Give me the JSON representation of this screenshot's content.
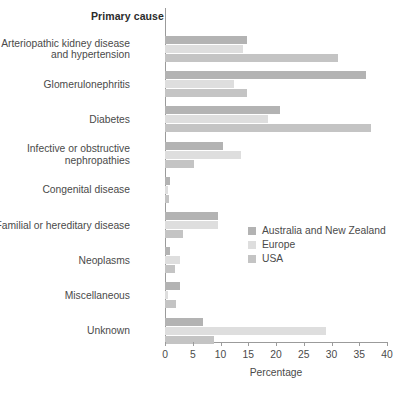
{
  "chart_data": {
    "type": "bar",
    "orientation": "horizontal",
    "title": "",
    "category_axis_title": "Primary cause",
    "xlabel": "Percentage",
    "ylabel": "",
    "xlim": [
      0,
      40
    ],
    "xticks": [
      0,
      5,
      10,
      15,
      20,
      25,
      30,
      35,
      40
    ],
    "grid": false,
    "legend_position": "middle-right",
    "categories": [
      "Arteriopathic kidney disease\nand hypertension",
      "Glomerulonephritis",
      "Diabetes",
      "Infective or obstructive\nnephropathies",
      "Congenital disease",
      "Familial or hereditary disease",
      "Neoplasms",
      "Miscellaneous",
      "Unknown"
    ],
    "series": [
      {
        "name": "Australia and New Zealand",
        "color": "#b3b3b3",
        "values": [
          14.8,
          36.2,
          20.7,
          10.5,
          0.9,
          9.6,
          0.9,
          2.7,
          6.8
        ]
      },
      {
        "name": "Europe",
        "color": "#dedede",
        "values": [
          14.0,
          12.4,
          18.6,
          13.7,
          0.6,
          9.6,
          2.7,
          0.6,
          29.0
        ]
      },
      {
        "name": "USA",
        "color": "#c4c4c4",
        "values": [
          31.2,
          14.8,
          37.1,
          5.3,
          0.8,
          3.3,
          1.8,
          2.0,
          8.8
        ]
      }
    ]
  },
  "legend": {
    "items": [
      {
        "label": "Australia and New Zealand",
        "color": "#b3b3b3"
      },
      {
        "label": "Europe",
        "color": "#dedede"
      },
      {
        "label": "USA",
        "color": "#c4c4c4"
      }
    ]
  }
}
